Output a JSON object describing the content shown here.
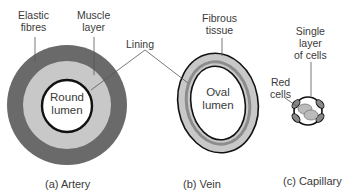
{
  "artery": {
    "caption": "(a) Artery",
    "labels": {
      "elastic_1": "Elastic",
      "elastic_2": "fibres",
      "muscle_1": "Muscle",
      "muscle_2": "layer",
      "lumen_1": "Round",
      "lumen_2": "lumen"
    }
  },
  "shared": {
    "lining": "Lining"
  },
  "vein": {
    "caption": "(b) Vein",
    "labels": {
      "fibrous_1": "Fibrous",
      "fibrous_2": "tissue",
      "lumen_1": "Oval",
      "lumen_2": "lumen"
    }
  },
  "capillary": {
    "caption": "(c) Capillary",
    "labels": {
      "single_1": "Single",
      "single_2": "layer",
      "single_3": "of cells",
      "red_1": "Red",
      "red_2": "cells"
    }
  },
  "colors": {
    "outer": "#6a6a6a",
    "mid": "#c8c8c8",
    "dark_band": "#8c8c8c",
    "outline": "#1a1a1a"
  }
}
